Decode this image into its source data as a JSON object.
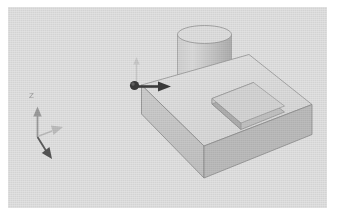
{
  "app": {
    "title": "3D Model Viewport",
    "view_type": "isometric-3d-solid-model"
  },
  "viewport": {
    "background_color": "#e2e2e2",
    "page_color": "#ffffff",
    "width": 319,
    "height": 201
  },
  "colors": {
    "face_top": "#e0e0e0",
    "face_front": "#c9c9c9",
    "face_right": "#b9b9b9",
    "pocket_floor": "#d4d4d4",
    "pocket_wall_left": "#b4b4b4",
    "pocket_wall_back": "#c2c2c2",
    "cylinder_top": "#dcdcdc",
    "cylinder_body": "#c6c6c6",
    "cylinder_shade": "#b2b2b2",
    "edge_line": "#8f8f8f",
    "arrow_dark": "#3c3c3c",
    "arrow_light": "#bdbdbd",
    "triad_color": "#8c8c8c",
    "label_color": "#9a9a9a"
  },
  "triad": {
    "name": "coordinate-axis-triad",
    "z_axis_label": "Z",
    "axes": [
      "Z",
      "X",
      "Y"
    ]
  },
  "origin_marker": {
    "name": "origin-datum-marker",
    "direction_arrow": "x-direction-arrow",
    "up_arrow": "z-direction-arrow"
  },
  "geometry": {
    "block": {
      "name": "rectangular-block",
      "features": [
        "rectangular-pocket"
      ]
    },
    "cylinder": {
      "name": "cylindrical-boss"
    },
    "pocket": {
      "name": "rectangular-pocket"
    }
  }
}
